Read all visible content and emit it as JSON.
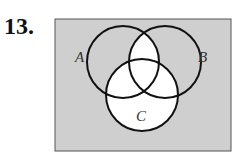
{
  "problem_number": "13.",
  "diagram": {
    "type": "venn",
    "sets": [
      "A",
      "B",
      "C"
    ],
    "labels": {
      "a": "A",
      "b": "B",
      "c": "C"
    },
    "shaded_regions": [
      "A only",
      "B only",
      "outside all sets"
    ],
    "unshaded_regions": [
      "C",
      "A ∩ B"
    ],
    "shade_color": "#cfcfcf"
  }
}
